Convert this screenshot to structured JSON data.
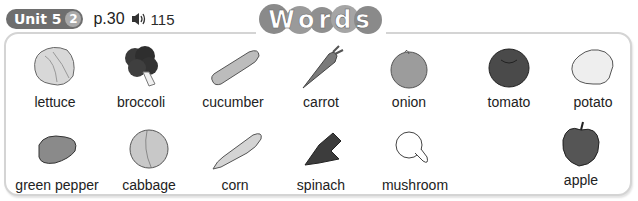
{
  "header": {
    "unit_label": "Unit 5",
    "lesson_number": "2",
    "page_ref": "p.30",
    "audio_icon": "speaker-icon",
    "track_number": "115"
  },
  "title": "Words",
  "items": [
    {
      "label": "lettuce",
      "icon": "lettuce-icon"
    },
    {
      "label": "broccoli",
      "icon": "broccoli-icon"
    },
    {
      "label": "cucumber",
      "icon": "cucumber-icon"
    },
    {
      "label": "carrot",
      "icon": "carrot-icon"
    },
    {
      "label": "onion",
      "icon": "onion-icon"
    },
    {
      "label": "tomato",
      "icon": "tomato-icon"
    },
    {
      "label": "potato",
      "icon": "potato-icon"
    },
    {
      "label": "green pepper",
      "icon": "green-pepper-icon"
    },
    {
      "label": "cabbage",
      "icon": "cabbage-icon"
    },
    {
      "label": "corn",
      "icon": "corn-icon"
    },
    {
      "label": "spinach",
      "icon": "spinach-icon"
    },
    {
      "label": "mushroom",
      "icon": "mushroom-icon"
    },
    {
      "label": "apple",
      "icon": "apple-icon"
    }
  ]
}
